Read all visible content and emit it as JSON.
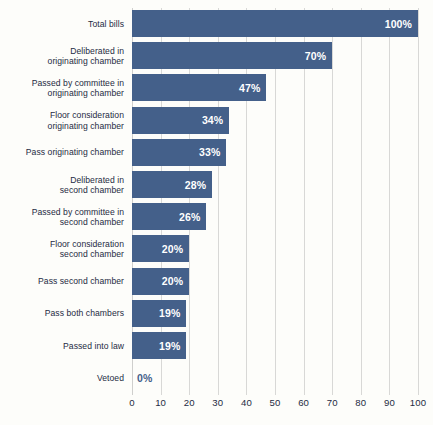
{
  "chart_data": {
    "type": "bar",
    "orientation": "horizontal",
    "title": "",
    "subtitle": "",
    "xlabel": "",
    "ylabel": "",
    "xlim": [
      0,
      100
    ],
    "xticks": [
      0,
      10,
      20,
      30,
      40,
      50,
      60,
      70,
      80,
      90,
      100
    ],
    "grid": true,
    "legend": false,
    "value_suffix": "%",
    "categories": [
      "Total bills",
      "Deliberated in\noriginating chamber",
      "Passed by committee in\noriginating chamber",
      "Floor consideration\noriginating chamber",
      "Pass originating chamber",
      "Deliberated in\nsecond chamber",
      "Passed by committee in\nsecond chamber",
      "Floor consideration\nsecond chamber",
      "Pass second chamber",
      "Pass both chambers",
      "Passed into law",
      "Vetoed"
    ],
    "values": [
      100,
      70,
      47,
      34,
      33,
      28,
      26,
      20,
      20,
      19,
      19,
      0
    ],
    "data_labels": [
      "100%",
      "70%",
      "47%",
      "34%",
      "33%",
      "28%",
      "26%",
      "20%",
      "20%",
      "19%",
      "19%",
      "0%"
    ],
    "colors": {
      "bar": "#44608a",
      "background": "#fdfdfa",
      "gridline": "#d8d8d6",
      "label_text": "#1d2b43",
      "value_text_inside": "#ffffff",
      "value_text_zero": "#44608a"
    }
  }
}
